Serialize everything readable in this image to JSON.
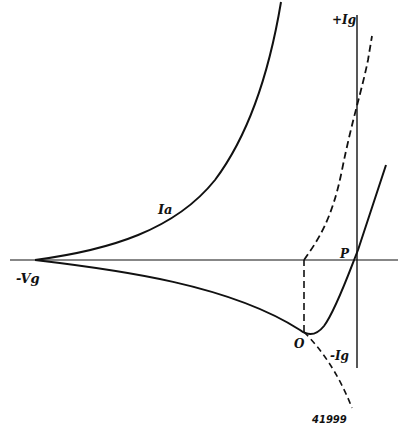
{
  "diagram": {
    "labels": {
      "neg_vg": "-Vg",
      "pos_ig": "+Ig",
      "neg_ig": "-Ig",
      "ia": "Ia",
      "point_p": "P",
      "point_o": "O"
    },
    "figure_number": "41999",
    "colors": {
      "ink": "#111111",
      "background": "#ffffff"
    }
  }
}
